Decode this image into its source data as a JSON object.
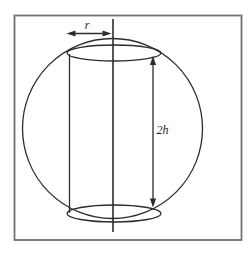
{
  "figure": {
    "kind": "cylinder-inscribed-in-sphere-diagram",
    "labels": {
      "radius": "r",
      "height": "2h"
    }
  },
  "colors": {
    "background": "#ffffff",
    "frame_border": "#707070",
    "line_ink": "#2c2c2c"
  }
}
